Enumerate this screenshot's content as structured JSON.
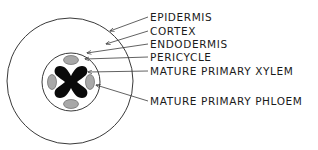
{
  "diagram": {
    "colors": {
      "line": "#3a3a3a",
      "xylem": "#0a0a0a",
      "phloem": "#a8a8a8",
      "background": "#ffffff"
    },
    "labels": [
      {
        "id": "epidermis",
        "text": "EPIDERMIS"
      },
      {
        "id": "cortex",
        "text": "CORTEX"
      },
      {
        "id": "endodermis",
        "text": "ENDODERMIS"
      },
      {
        "id": "pericycle",
        "text": "PERICYCLE"
      },
      {
        "id": "xylem",
        "text": "MATURE PRIMARY XYLEM"
      },
      {
        "id": "phloem",
        "text": "MATURE PRIMARY PHLOEM"
      }
    ]
  }
}
